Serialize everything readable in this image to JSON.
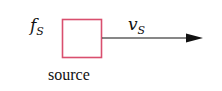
{
  "diagram": {
    "source_box": {
      "label": "source",
      "stroke_color": "#d94f6e"
    },
    "frequency_label": {
      "symbol": "f",
      "subscript": "S"
    },
    "velocity_label": {
      "symbol": "v",
      "subscript": "S"
    },
    "arrow": {
      "direction": "right",
      "color": "#111111"
    }
  }
}
